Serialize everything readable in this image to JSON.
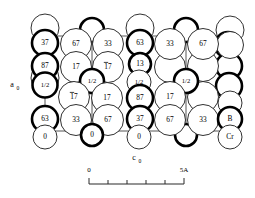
{
  "figure": {
    "type": "crystal-structure-projection",
    "axes": {
      "vertical_label": "a",
      "vertical_subscript": "0",
      "horizontal_label": "c",
      "horizontal_subscript": "0"
    },
    "legend": {
      "boron_label": "B",
      "chromium_label": "Cr"
    },
    "scale_bar": {
      "start_label": "0",
      "end_label": "5A",
      "tick_count": 6
    },
    "atoms": [
      {
        "id": "a1",
        "label": "37",
        "x": 45,
        "y": 43,
        "r": 13.0,
        "weight": "thick",
        "overbar": false
      },
      {
        "id": "a2",
        "label": "67",
        "x": 76,
        "y": 44,
        "r": 15.5,
        "weight": "thin",
        "overbar": false
      },
      {
        "id": "a3",
        "label": "33",
        "x": 108,
        "y": 44,
        "r": 15.5,
        "weight": "thin",
        "overbar": false
      },
      {
        "id": "a4",
        "label": "63",
        "x": 140,
        "y": 43,
        "r": 13.0,
        "weight": "thick",
        "overbar": false
      },
      {
        "id": "a5",
        "label": "33",
        "x": 170,
        "y": 44,
        "r": 15.5,
        "weight": "thin",
        "overbar": false
      },
      {
        "id": "a6",
        "label": "67",
        "x": 203,
        "y": 44,
        "r": 15.5,
        "weight": "thin",
        "overbar": false
      },
      {
        "id": "b1",
        "label": "87",
        "x": 45,
        "y": 66,
        "r": 13.0,
        "weight": "thick",
        "overbar": false
      },
      {
        "id": "b2",
        "label": "17",
        "x": 76,
        "y": 67,
        "r": 15.5,
        "weight": "thin",
        "overbar": false
      },
      {
        "id": "b3",
        "label": "17",
        "x": 108,
        "y": 67,
        "r": 15.5,
        "weight": "thin",
        "overbar": true
      },
      {
        "id": "b4",
        "label": "13",
        "x": 140,
        "y": 64,
        "r": 11.0,
        "weight": "thick",
        "overbar": false
      },
      {
        "id": "c1",
        "label": "1/2",
        "x": 45,
        "y": 85,
        "r": 12.5,
        "weight": "thick",
        "overbar": false
      },
      {
        "id": "c2",
        "label": "1/2",
        "x": 92,
        "y": 81,
        "r": 12.0,
        "weight": "thick",
        "overbar": false
      },
      {
        "id": "c3",
        "label": "1/2",
        "x": 139,
        "y": 82,
        "r": 12.0,
        "weight": "thin",
        "overbar": false
      },
      {
        "id": "c4",
        "label": "1/2",
        "x": 186,
        "y": 81,
        "r": 12.0,
        "weight": "thick",
        "overbar": false
      },
      {
        "id": "d1",
        "label": "17",
        "x": 74,
        "y": 97,
        "r": 15.5,
        "weight": "thin",
        "overbar": true
      },
      {
        "id": "d2",
        "label": "17",
        "x": 107,
        "y": 98,
        "r": 15.5,
        "weight": "thin",
        "overbar": false
      },
      {
        "id": "d3",
        "label": "87",
        "x": 140,
        "y": 98,
        "r": 13.0,
        "weight": "thick",
        "overbar": false
      },
      {
        "id": "d4",
        "label": "17",
        "x": 170,
        "y": 97,
        "r": 15.5,
        "weight": "thin",
        "overbar": false
      },
      {
        "id": "e1",
        "label": "63",
        "x": 45,
        "y": 119,
        "r": 13.0,
        "weight": "thick",
        "overbar": false
      },
      {
        "id": "e2",
        "label": "33",
        "x": 76,
        "y": 120,
        "r": 15.5,
        "weight": "thin",
        "overbar": false
      },
      {
        "id": "e3",
        "label": "67",
        "x": 108,
        "y": 120,
        "r": 15.5,
        "weight": "thin",
        "overbar": false
      },
      {
        "id": "e4",
        "label": "37",
        "x": 140,
        "y": 119,
        "r": 13.0,
        "weight": "thick",
        "overbar": false
      },
      {
        "id": "e5",
        "label": "67",
        "x": 170,
        "y": 120,
        "r": 15.5,
        "weight": "thin",
        "overbar": false
      },
      {
        "id": "e6",
        "label": "33",
        "x": 203,
        "y": 120,
        "r": 15.5,
        "weight": "thin",
        "overbar": false
      },
      {
        "id": "e7",
        "label": "B",
        "x": 230,
        "y": 119,
        "r": 12.0,
        "weight": "thick",
        "overbar": false
      },
      {
        "id": "f1",
        "label": "0",
        "x": 45,
        "y": 137,
        "r": 12.0,
        "weight": "thin",
        "overbar": false
      },
      {
        "id": "f2",
        "label": "0",
        "x": 92,
        "y": 135,
        "r": 11.0,
        "weight": "thick",
        "overbar": false
      },
      {
        "id": "f3",
        "label": "0",
        "x": 139,
        "y": 137,
        "r": 12.0,
        "weight": "thin",
        "overbar": false
      },
      {
        "id": "f4",
        "label": "Cr",
        "x": 230,
        "y": 137,
        "r": 12.0,
        "weight": "thin",
        "overbar": false
      }
    ],
    "background_atoms": [
      {
        "id": "bg1",
        "x": 45,
        "y": 28,
        "r": 14.0,
        "weight": "thin"
      },
      {
        "id": "bg2",
        "x": 92,
        "y": 30,
        "r": 12.0,
        "weight": "thick"
      },
      {
        "id": "bg3",
        "x": 140,
        "y": 28,
        "r": 14.0,
        "weight": "thin"
      },
      {
        "id": "bg4",
        "x": 186,
        "y": 30,
        "r": 12.0,
        "weight": "thick"
      },
      {
        "id": "bg5",
        "x": 230,
        "y": 30,
        "r": 14.0,
        "weight": "thin"
      },
      {
        "id": "bg6",
        "x": 228,
        "y": 45,
        "r": 13.0,
        "weight": "thick"
      },
      {
        "id": "bg7",
        "x": 229,
        "y": 66,
        "r": 13.0,
        "weight": "thick"
      },
      {
        "id": "bg8",
        "x": 229,
        "y": 86,
        "r": 13.0,
        "weight": "thick"
      },
      {
        "id": "bg9",
        "x": 230,
        "y": 103,
        "r": 12.0,
        "weight": "thin"
      },
      {
        "id": "bg10",
        "x": 45,
        "y": 78,
        "r": 14.0,
        "weight": "thin"
      },
      {
        "id": "bg11",
        "x": 203,
        "y": 66,
        "r": 15.5,
        "weight": "thin"
      },
      {
        "id": "bg12",
        "x": 170,
        "y": 67,
        "r": 15.5,
        "weight": "thin"
      },
      {
        "id": "bg13",
        "x": 203,
        "y": 97,
        "r": 15.5,
        "weight": "thin"
      },
      {
        "id": "bg14",
        "x": 186,
        "y": 135,
        "r": 11.0,
        "weight": "thick"
      },
      {
        "id": "bg15",
        "x": 230,
        "y": 45,
        "r": 13.5,
        "weight": "thin"
      }
    ],
    "cell_edges": [
      {
        "id": "edge-top",
        "x1": 45,
        "y1": 36,
        "x2": 230,
        "y2": 36
      },
      {
        "id": "edge-bottom",
        "x1": 45,
        "y1": 131,
        "x2": 230,
        "y2": 131
      },
      {
        "id": "edge-left",
        "x1": 45,
        "y1": 36,
        "x2": 45,
        "y2": 131
      },
      {
        "id": "edge-right",
        "x1": 230,
        "y1": 36,
        "x2": 230,
        "y2": 131
      },
      {
        "id": "edge-v1",
        "x1": 92,
        "y1": 36,
        "x2": 92,
        "y2": 131
      },
      {
        "id": "edge-v2",
        "x1": 139,
        "y1": 36,
        "x2": 139,
        "y2": 131
      },
      {
        "id": "edge-v3",
        "x1": 186,
        "y1": 36,
        "x2": 186,
        "y2": 131
      }
    ]
  }
}
